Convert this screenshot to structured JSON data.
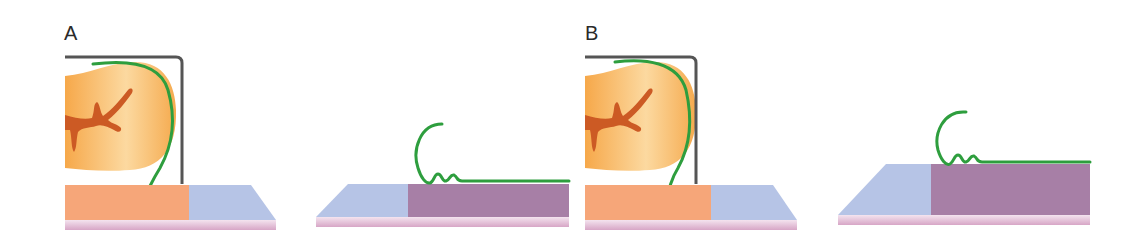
{
  "figure": {
    "panels": [
      {
        "label": "A"
      },
      {
        "label": "B"
      }
    ]
  },
  "colors": {
    "tooth": "#f4a94a",
    "tooth_light": "#fcd9a0",
    "pulp": "#cc5a24",
    "frame": "#555555",
    "membrane": "#2e9e3e",
    "orange_tissue": "#f6a679",
    "blue_tissue": "#b6c4e6",
    "purple_tissue": "#a77fa6",
    "pink_base": "#e2b6d2"
  }
}
